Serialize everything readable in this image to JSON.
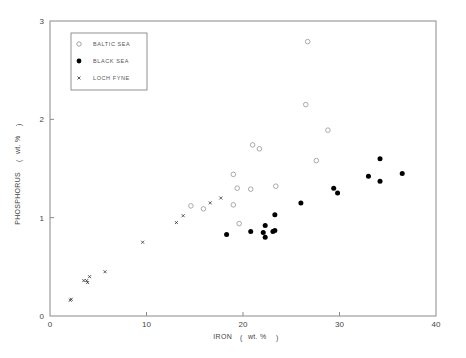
{
  "chart_data": {
    "type": "scatter",
    "title": "",
    "xlabel": "IRON ( wt. % )",
    "ylabel": "PHOSPHORUS ( wt. % )",
    "xlim": [
      0,
      40
    ],
    "ylim": [
      0,
      3
    ],
    "xticks": [
      0,
      10,
      20,
      30,
      40
    ],
    "yticks": [
      0,
      1,
      2,
      3
    ],
    "grid": false,
    "legend_position": "upper left",
    "series": [
      {
        "name": "BALTIC SEA",
        "marker": "open-circle",
        "color": "#999999",
        "points": [
          [
            26.7,
            2.79
          ],
          [
            26.5,
            2.15
          ],
          [
            28.8,
            1.89
          ],
          [
            21.0,
            1.74
          ],
          [
            21.7,
            1.7
          ],
          [
            27.6,
            1.58
          ],
          [
            19.0,
            1.44
          ],
          [
            19.4,
            1.3
          ],
          [
            20.8,
            1.29
          ],
          [
            23.4,
            1.32
          ],
          [
            14.6,
            1.12
          ],
          [
            15.9,
            1.09
          ],
          [
            19.0,
            1.13
          ],
          [
            19.6,
            0.94
          ]
        ]
      },
      {
        "name": "BLACK SEA",
        "marker": "filled-circle",
        "color": "#000000",
        "points": [
          [
            18.3,
            0.83
          ],
          [
            20.8,
            0.86
          ],
          [
            22.3,
            0.92
          ],
          [
            22.1,
            0.85
          ],
          [
            22.3,
            0.8
          ],
          [
            23.1,
            0.86
          ],
          [
            23.3,
            0.87
          ],
          [
            23.3,
            1.03
          ],
          [
            26.0,
            1.15
          ],
          [
            29.4,
            1.3
          ],
          [
            29.8,
            1.25
          ],
          [
            33.0,
            1.42
          ],
          [
            34.2,
            1.37
          ],
          [
            34.2,
            1.6
          ],
          [
            36.5,
            1.45
          ]
        ]
      },
      {
        "name": "LOCH FYNE",
        "marker": "cross",
        "color": "#222222",
        "points": [
          [
            17.7,
            1.2
          ],
          [
            16.6,
            1.15
          ],
          [
            13.8,
            1.02
          ],
          [
            13.1,
            0.95
          ],
          [
            9.6,
            0.75
          ],
          [
            5.7,
            0.45
          ],
          [
            4.1,
            0.4
          ],
          [
            3.8,
            0.36
          ],
          [
            3.9,
            0.34
          ],
          [
            3.5,
            0.36
          ],
          [
            2.2,
            0.17
          ],
          [
            2.1,
            0.16
          ]
        ]
      }
    ]
  },
  "labels": {
    "x_axis_main": "IRON",
    "x_axis_unit": "wt. %",
    "y_axis_main": "PHOSPHORUS",
    "y_axis_unit": "wt. %"
  },
  "legend": [
    {
      "label": "BALTIC SEA",
      "marker": "open-circle"
    },
    {
      "label": "BLACK SEA",
      "marker": "filled-circle"
    },
    {
      "label": "LOCH FYNE",
      "marker": "cross"
    }
  ]
}
